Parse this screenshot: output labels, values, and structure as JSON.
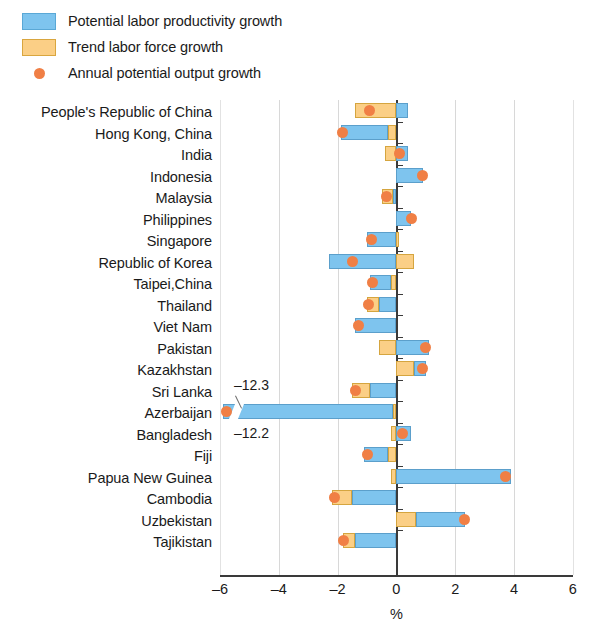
{
  "legend": {
    "items": [
      {
        "label": "Potential labor productivity growth",
        "type": "swatch",
        "color": "#7ec4ee",
        "icon": "blue-square-swatch"
      },
      {
        "label": "Trend labor force growth",
        "type": "swatch",
        "color": "#fbcf86",
        "icon": "orange-square-swatch"
      },
      {
        "label": "Annual potential output growth",
        "type": "marker",
        "color": "#f07f45",
        "icon": "orange-dot-marker"
      }
    ]
  },
  "chart_data": {
    "type": "bar",
    "orientation": "horizontal",
    "stacked": true,
    "title": "",
    "subtitle": "",
    "xlabel": "%",
    "ylabel": "",
    "xlim": [
      -6,
      6
    ],
    "xticks": [
      -6,
      -4,
      -2,
      0,
      2,
      4,
      6
    ],
    "xtick_labels": [
      "–6",
      "–4",
      "–2",
      "0",
      "2",
      "4",
      "6"
    ],
    "grid": true,
    "legend_position": "top-left",
    "categories": [
      "People's Republic of China",
      "Hong Kong, China",
      "India",
      "Indonesia",
      "Malaysia",
      "Philippines",
      "Singapore",
      "Republic of Korea",
      "Taipei,China",
      "Thailand",
      "Viet Nam",
      "Pakistan",
      "Kazakhstan",
      "Sri Lanka",
      "Azerbaijan",
      "Bangladesh",
      "Fiji",
      "Papua New Guinea",
      "Cambodia",
      "Uzbekistan",
      "Tajikistan"
    ],
    "series": [
      {
        "name": "Potential labor productivity growth",
        "color": "#7ec4ee",
        "values": [
          0.4,
          -1.6,
          0.4,
          0.9,
          -0.1,
          0.5,
          -1.0,
          -2.3,
          -0.7,
          -0.6,
          -1.4,
          1.1,
          0.4,
          -0.9,
          -12.2,
          0.5,
          -0.8,
          3.9,
          -1.5,
          1.7,
          -1.4
        ]
      },
      {
        "name": "Trend labor force growth",
        "color": "#fbcf86",
        "values": [
          -1.4,
          -0.3,
          -0.4,
          0.0,
          -0.4,
          0.0,
          0.1,
          0.6,
          -0.2,
          -0.4,
          0.0,
          -0.6,
          0.6,
          -0.6,
          -0.1,
          -0.2,
          -0.3,
          -0.2,
          -0.7,
          0.65,
          -0.4
        ]
      }
    ],
    "marker_series": {
      "name": "Annual potential output growth",
      "color": "#f07f45",
      "values": [
        -0.9,
        -1.85,
        0.1,
        0.9,
        -0.35,
        0.5,
        -0.85,
        -1.5,
        -0.8,
        -0.95,
        -1.3,
        1.0,
        0.9,
        -1.4,
        -12.3,
        0.2,
        -1.0,
        3.7,
        -2.1,
        2.3,
        -1.8
      ]
    },
    "annotations": [
      {
        "text": "–12.3",
        "refers_to": "Azerbaijan",
        "series": "Annual potential output growth"
      },
      {
        "text": "–12.2",
        "refers_to": "Azerbaijan",
        "series": "Potential labor productivity growth"
      }
    ],
    "axis_break": {
      "category": "Azerbaijan",
      "at": -5.6
    }
  }
}
